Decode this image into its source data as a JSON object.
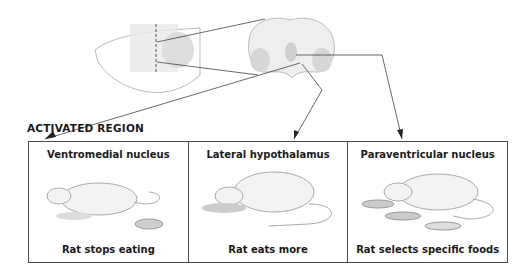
{
  "section_label": "ACTIVATED REGION",
  "panels": [
    {
      "region": "Ventromedial nucleus",
      "effect": "Rat stops eating"
    },
    {
      "region": "Lateral hypothalamus",
      "effect": "Rat eats more"
    },
    {
      "region": "Paraventricular nucleus",
      "effect": "Rat selects specific foods"
    }
  ]
}
